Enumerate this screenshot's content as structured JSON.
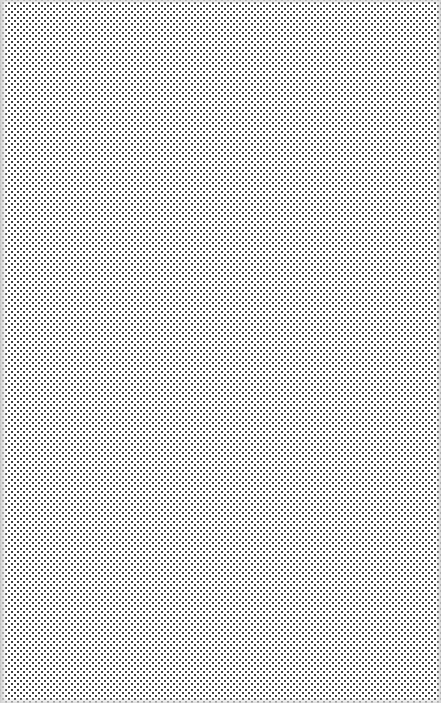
{
  "canvas": {
    "description": "Dot pattern texture",
    "pattern": "staggered-dot-grid",
    "dot_color": "#3c3c3c",
    "background_color": "#ffffff",
    "dot_spacing_px": 6,
    "edge_color": "#d0d0d0"
  }
}
